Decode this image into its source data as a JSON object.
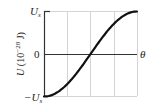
{
  "chart_data": {
    "type": "line",
    "title": "",
    "xlabel": "θ",
    "ylabel": "U (10⁻²⁸ J)",
    "ylabel_parts": {
      "var": "U",
      "unit_prefix": " (10",
      "exponent": "−28",
      "unit_suffix": " J)"
    },
    "y_ticks": [
      "U_s",
      "0",
      "−U_s"
    ],
    "y_tick_labels": {
      "top_var": "U",
      "top_sub": "s",
      "zero": "0",
      "bottom_prefix": "−U",
      "bottom_sub": "s"
    },
    "ylim": [
      -1,
      1
    ],
    "x_grid_divisions": 4,
    "grid": true,
    "series": [
      {
        "name": "U(θ) = −U_s cos θ",
        "x": [
          0,
          22.5,
          45,
          67.5,
          90,
          112.5,
          135,
          157.5,
          180
        ],
        "values": [
          -1,
          -0.924,
          -0.707,
          -0.383,
          0,
          0.383,
          0.707,
          0.924,
          1
        ]
      }
    ],
    "colors": {
      "curve": "#111111",
      "axis": "#333333",
      "grid": "#d0d0d0"
    }
  }
}
